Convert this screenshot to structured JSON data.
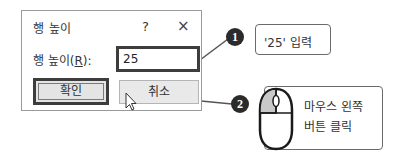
{
  "dialog": {
    "title": "행 높이",
    "help_label": "?",
    "close_label": "×",
    "field_label_prefix": "행 높이(",
    "field_label_accel": "R",
    "field_label_suffix": "):",
    "row_height_value": "25",
    "ok_label": "확인",
    "cancel_label": "취소"
  },
  "callouts": [
    {
      "number": "1",
      "text": "'25' 입력"
    },
    {
      "number": "2",
      "line1": "마우스 왼쪽",
      "line2": "버튼 클릭",
      "icon": "mouse-left-click-icon"
    }
  ],
  "colors": {
    "highlight_border": "#3d3d3d",
    "badge": "#2b2b2b",
    "mouse_left_fill": "#c8c8c8"
  }
}
